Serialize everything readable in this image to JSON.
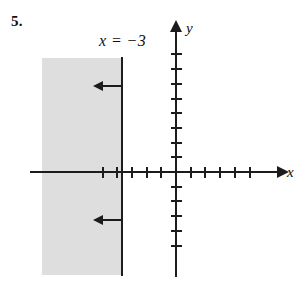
{
  "problem": {
    "number": "5."
  },
  "chart_data": {
    "type": "line",
    "title": "",
    "subtitle": "",
    "xlabel": "x",
    "ylabel": "y",
    "xlim": [
      -10,
      7
    ],
    "ylim": [
      -7,
      8
    ],
    "grid": false,
    "legend": "none",
    "tick_spacing": 1,
    "axes": {
      "x_axis_label": "x",
      "y_axis_label": "y",
      "x_ticks_left_of_origin": 5,
      "x_ticks_right_of_origin": 5,
      "y_ticks_above_origin": 8,
      "y_ticks_below_origin": 5,
      "tick_labels_shown": false,
      "origin": [
        0,
        0
      ],
      "arrowheads": [
        "x-positive",
        "y-positive"
      ]
    },
    "boundary": {
      "label": "x = −3",
      "equation_x_value": -3,
      "style": "solid",
      "inclusive": true,
      "orientation": "vertical"
    },
    "shading": {
      "description": "half-plane shaded to the left of x = -3",
      "inequality": "x ≤ −3",
      "direction": "left",
      "color": "#dedede"
    },
    "annotations": [
      {
        "type": "direction-arrow",
        "points": "left",
        "at_y": 4
      },
      {
        "type": "direction-arrow",
        "points": "left",
        "at_y": -3
      }
    ],
    "colors": {
      "ink": "#1c1c1c",
      "shade": "#dedede",
      "background": "#ffffff"
    }
  }
}
